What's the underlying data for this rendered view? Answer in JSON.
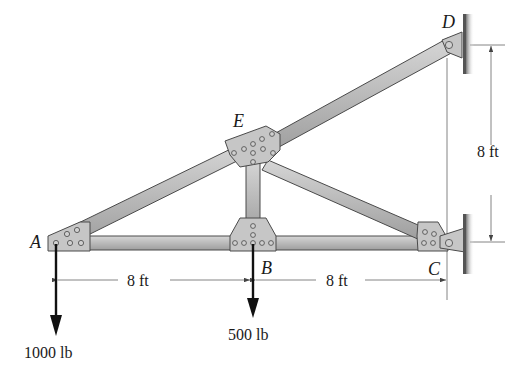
{
  "figure": {
    "type": "truss-diagram",
    "joints": {
      "A": {
        "label": "A",
        "x": 55,
        "y": 242
      },
      "B": {
        "label": "B",
        "x": 253,
        "y": 242
      },
      "C": {
        "label": "C",
        "x": 440,
        "y": 242
      },
      "D": {
        "label": "D",
        "x": 452,
        "y": 45
      },
      "E": {
        "label": "E",
        "x": 253,
        "y": 150
      }
    },
    "members": [
      "AB",
      "BC",
      "AE",
      "ED",
      "BE",
      "EC"
    ],
    "supports": [
      {
        "joint": "D",
        "type": "pin-wall"
      },
      {
        "joint": "C",
        "type": "pin-wall"
      }
    ],
    "dimensions": {
      "AB": "8 ft",
      "BC": "8 ft",
      "CD_vertical": "8 ft"
    },
    "loads": [
      {
        "joint": "A",
        "label": "1000 lb",
        "direction": "down"
      },
      {
        "joint": "B",
        "label": "500 lb",
        "direction": "down"
      }
    ],
    "colors": {
      "member_fill": "#b8b8b8",
      "member_edge": "#4a4a4a",
      "plate_fill": "#c4c4c4",
      "wall": "#555555",
      "arrow": "#111111",
      "dim_line": "#555555"
    }
  }
}
